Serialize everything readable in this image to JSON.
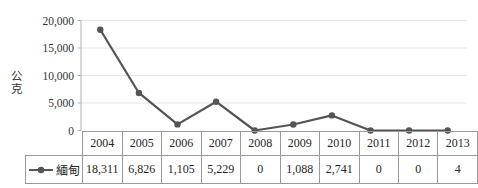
{
  "chart_data": {
    "type": "line",
    "title": "",
    "ylabel": "公克",
    "xlabel": "",
    "categories": [
      "2004",
      "2005",
      "2006",
      "2007",
      "2008",
      "2009",
      "2010",
      "2011",
      "2012",
      "2013"
    ],
    "series": [
      {
        "name": "緬甸",
        "values": [
          18311,
          6826,
          1105,
          5229,
          0,
          1088,
          2741,
          0,
          0,
          4
        ]
      }
    ],
    "values_display": [
      "18,311",
      "6,826",
      "1,105",
      "5,229",
      "0",
      "1,088",
      "2,741",
      "0",
      "0",
      "4"
    ],
    "yticks": {
      "values": [
        0,
        5000,
        10000,
        15000,
        20000
      ],
      "labels": [
        "0",
        "5,000",
        "10,000",
        "15,000",
        "20,000"
      ]
    },
    "ylim": [
      0,
      20000
    ],
    "grid": true,
    "legend_position": "table-left",
    "colors": {
      "line": "#545454",
      "marker": "#545454",
      "grid": "#e4e4e4",
      "axis": "#b0b0b0",
      "table_border": "#999999",
      "text": "#262626"
    }
  }
}
